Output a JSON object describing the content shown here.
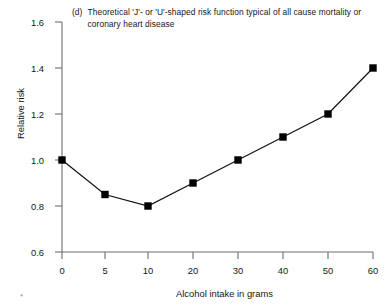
{
  "figure": {
    "panel_tag": "(d)",
    "title_line1": "Theoretical 'J'- or 'U'-shaped risk function typical of all cause",
    "title_line2": "mortality or coronary heart disease",
    "corner_mark": "*",
    "line_color": "#111111",
    "marker_color": "#000000",
    "axis_color": "#6e6e6e",
    "background": "#ffffff"
  },
  "chart_data": {
    "type": "line",
    "title": "(d) Theoretical 'J'- or 'U'-shaped risk function typical of all cause mortality or coronary heart disease",
    "xlabel": "Alcohol intake in grams",
    "ylabel": "Relative risk",
    "x": [
      0,
      5,
      10,
      20,
      30,
      40,
      50,
      60
    ],
    "values": [
      1.0,
      0.85,
      0.8,
      0.9,
      1.0,
      1.1,
      1.2,
      1.4
    ],
    "series": [
      {
        "name": "Relative risk",
        "values": [
          1.0,
          0.85,
          0.8,
          0.9,
          1.0,
          1.1,
          1.2,
          1.4
        ]
      }
    ],
    "xtick_labels": [
      "0",
      "5",
      "10",
      "20",
      "30",
      "40",
      "50",
      "60"
    ],
    "ytick_labels": [
      "0.6",
      "0.8",
      "1.0",
      "1.2",
      "1.4",
      "1.6"
    ],
    "yticks": [
      0.6,
      0.8,
      1.0,
      1.2,
      1.4,
      1.6
    ],
    "ylim": [
      0.6,
      1.6
    ],
    "xlim": [
      0,
      60
    ],
    "x_axis_scale": "non-uniform (0,5,10 spaced like 10,20,30)",
    "grid": false,
    "legend": "none",
    "marker": "filled square",
    "data_labels": [
      {
        "x": 0,
        "y": 1.0
      },
      {
        "x": 5,
        "y": 0.85
      },
      {
        "x": 10,
        "y": 0.8
      },
      {
        "x": 20,
        "y": 0.9
      },
      {
        "x": 30,
        "y": 1.0
      },
      {
        "x": 40,
        "y": 1.1
      },
      {
        "x": 50,
        "y": 1.2
      },
      {
        "x": 60,
        "y": 1.4
      }
    ]
  },
  "axes": {
    "y_ticks": [
      {
        "label": "1.6",
        "top": 17
      },
      {
        "label": "1.4",
        "top": 63
      },
      {
        "label": "1.2",
        "top": 109
      },
      {
        "label": "1.0",
        "top": 155
      },
      {
        "label": "0.8",
        "top": 201
      },
      {
        "label": "0.6",
        "top": 247
      }
    ],
    "x_ticks": [
      {
        "label": "0",
        "left": 50
      },
      {
        "label": "5",
        "left": 93
      },
      {
        "label": "10",
        "left": 136
      },
      {
        "label": "20",
        "left": 181
      },
      {
        "label": "30",
        "left": 226
      },
      {
        "label": "40",
        "left": 271
      },
      {
        "label": "50",
        "left": 316
      },
      {
        "label": "60",
        "left": 361
      }
    ]
  }
}
